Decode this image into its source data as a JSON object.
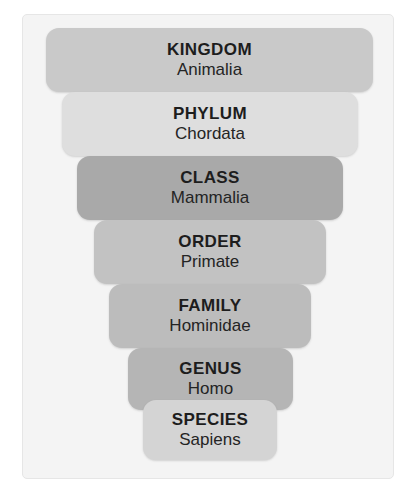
{
  "figure": {
    "panel_background": "#f4f4f4",
    "panel_border": "#e6e6e6"
  },
  "chart_data": {
    "type": "bar",
    "xlabel": "",
    "ylabel": "",
    "orientation": "horizontal",
    "shape": "inverted-pyramid-funnel",
    "categories": [
      "KINGDOM",
      "PHYLUM",
      "CLASS",
      "ORDER",
      "FAMILY",
      "GENUS",
      "SPECIES"
    ],
    "values": [
      327,
      296,
      266,
      232,
      202,
      165,
      134
    ],
    "value_unit": "px bar width",
    "series": [
      {
        "name": "Taxon",
        "values": [
          "Animalia",
          "Chordata",
          "Mammalia",
          "Primate",
          "Hominidae",
          "Homo",
          "Sapiens"
        ]
      }
    ],
    "grid": false,
    "legend": false
  },
  "ranks": [
    {
      "rank": "KINGDOM",
      "taxon": "Animalia",
      "color": "#c9c9c9",
      "left": 46,
      "top": 28,
      "width": 327,
      "height": 64
    },
    {
      "rank": "PHYLUM",
      "taxon": "Chordata",
      "color": "#dedede",
      "left": 62,
      "top": 92,
      "width": 296,
      "height": 64
    },
    {
      "rank": "CLASS",
      "taxon": "Mammalia",
      "color": "#a9a9a9",
      "left": 77,
      "top": 156,
      "width": 266,
      "height": 64
    },
    {
      "rank": "ORDER",
      "taxon": "Primate",
      "color": "#c2c2c2",
      "left": 94,
      "top": 220,
      "width": 232,
      "height": 64
    },
    {
      "rank": "FAMILY",
      "taxon": "Hominidae",
      "color": "#bcbcbc",
      "left": 109,
      "top": 284,
      "width": 202,
      "height": 64
    },
    {
      "rank": "GENUS",
      "taxon": "Homo",
      "color": "#b5b5b5",
      "left": 128,
      "top": 348,
      "width": 165,
      "height": 62
    },
    {
      "rank": "SPECIES",
      "taxon": "Sapiens",
      "color": "#d4d4d4",
      "left": 143,
      "top": 400,
      "width": 134,
      "height": 60
    }
  ]
}
